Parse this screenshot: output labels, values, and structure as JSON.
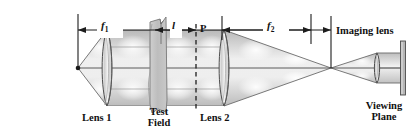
{
  "diagram": {
    "background_color": "#ffffff",
    "line_color": "#333333",
    "beam_fill": "#d8d8d8",
    "glass_fill": "#c9c9c9",
    "labels": {
      "f1": "f",
      "f1_sub": "1",
      "f2": "f",
      "f2_sub": "2",
      "l": "l",
      "point_p": "P",
      "lens1": "Lens 1",
      "lens2": "Lens 2",
      "test_field_line1": "Test",
      "test_field_line2": "Field",
      "imaging_lens": "Imaging lens",
      "viewing_plane_line1": "Viewing",
      "viewing_plane_line2": "Plane"
    },
    "dimensions": [
      {
        "name": "f1",
        "label": "f₁",
        "from_x": 78,
        "to_x": 311,
        "y": 30
      },
      {
        "name": "l",
        "label": "l",
        "from_x": 155,
        "to_x": 196,
        "y": 30
      },
      {
        "name": "f2",
        "label": "f₂",
        "from_x": 222,
        "to_x": 331,
        "y": 30
      }
    ],
    "components": [
      {
        "name": "point-source",
        "type": "source",
        "x": 78,
        "y": 68
      },
      {
        "name": "lens-1",
        "type": "biconvex-lens",
        "x": 107,
        "y": 68,
        "half_height": 38
      },
      {
        "name": "test-field",
        "type": "test-section",
        "x": 158,
        "y": 68
      },
      {
        "name": "plane-p",
        "type": "reference-plane",
        "x": 196,
        "y": 68
      },
      {
        "name": "lens-2",
        "type": "biconvex-lens",
        "x": 224,
        "y": 68,
        "half_height": 38
      },
      {
        "name": "focal-point",
        "type": "crossing-point",
        "x": 331,
        "y": 68
      },
      {
        "name": "imaging-lens",
        "type": "biconvex-lens",
        "x": 377,
        "y": 68,
        "half_height": 15
      },
      {
        "name": "viewing-plane",
        "type": "screen",
        "x": 403,
        "y": 68
      }
    ]
  }
}
